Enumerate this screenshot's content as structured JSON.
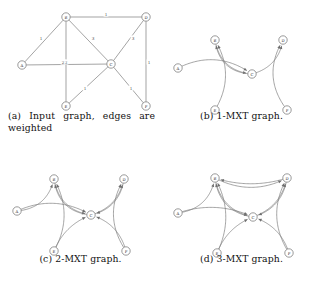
{
  "figure": {
    "panel_count": 4,
    "node_ids": [
      "A",
      "B",
      "C",
      "D",
      "E",
      "F"
    ],
    "edge_color": "#7c7c7c",
    "node_fill": "#ffffff",
    "node_stroke": "#6e6e6e"
  },
  "panels": [
    {
      "key": "a",
      "caption": "(a) Input graph, edges are weighted",
      "caption_label": "(a)",
      "caption_text": "Input graph, edges are weighted",
      "directed": false,
      "nodes": [
        {
          "id": "A",
          "label": "A",
          "x": 22,
          "y": 65
        },
        {
          "id": "B",
          "label": "B",
          "x": 66,
          "y": 17
        },
        {
          "id": "C",
          "label": "C",
          "x": 111,
          "y": 64
        },
        {
          "id": "D",
          "label": "D",
          "x": 146,
          "y": 17
        },
        {
          "id": "E",
          "label": "E",
          "x": 66,
          "y": 106
        },
        {
          "id": "F",
          "label": "F",
          "x": 146,
          "y": 106
        }
      ],
      "edges": [
        {
          "from": "A",
          "to": "B",
          "weight": "1",
          "wx": 41,
          "wy": 38
        },
        {
          "from": "A",
          "to": "C",
          "weight": "2",
          "wx": 66,
          "wy": 62
        },
        {
          "from": "B",
          "to": "D",
          "weight": "1",
          "wx": 106,
          "wy": 14
        },
        {
          "from": "B",
          "to": "C",
          "weight": "3",
          "wx": 93,
          "wy": 38
        },
        {
          "from": "B",
          "to": "E",
          "weight": "2",
          "wx": 63,
          "wy": 62
        },
        {
          "from": "C",
          "to": "D",
          "weight": "3",
          "wx": 133,
          "wy": 38
        },
        {
          "from": "C",
          "to": "E",
          "weight": "1",
          "wx": 85,
          "wy": 88
        },
        {
          "from": "C",
          "to": "F",
          "weight": "1",
          "wx": 131,
          "wy": 88
        },
        {
          "from": "D",
          "to": "F",
          "weight": "1",
          "wx": 149,
          "wy": 62
        }
      ]
    },
    {
      "key": "b",
      "caption": "(b) 1-MXT graph.",
      "caption_label": "(b)",
      "caption_text": "1-MXT graph.",
      "directed": true,
      "nodes": [
        {
          "id": "A",
          "label": "A",
          "x": 17,
          "y": 68
        },
        {
          "id": "B",
          "label": "B",
          "x": 54,
          "y": 40
        },
        {
          "id": "C",
          "label": "C",
          "x": 91,
          "y": 74
        },
        {
          "id": "D",
          "label": "D",
          "x": 122,
          "y": 40
        },
        {
          "id": "E",
          "label": "E",
          "x": 54,
          "y": 110
        },
        {
          "id": "F",
          "label": "F",
          "x": 126,
          "y": 110
        }
      ],
      "arcs": [
        {
          "from": "A",
          "to": "C",
          "bow": -0.3
        },
        {
          "from": "B",
          "to": "C",
          "bow": 0.38
        },
        {
          "from": "C",
          "to": "B",
          "bow": -0.42
        },
        {
          "from": "E",
          "to": "B",
          "bow": 0.3
        },
        {
          "from": "C",
          "to": "D",
          "bow": 0.32
        },
        {
          "from": "F",
          "to": "D",
          "bow": -0.34
        }
      ]
    },
    {
      "key": "c",
      "caption": "(c) 2-MXT graph.",
      "caption_label": "(c)",
      "caption_text": "2-MXT graph.",
      "directed": true,
      "nodes": [
        {
          "id": "A",
          "label": "A",
          "x": 17,
          "y": 68
        },
        {
          "id": "B",
          "label": "B",
          "x": 54,
          "y": 36
        },
        {
          "id": "C",
          "label": "C",
          "x": 91,
          "y": 72
        },
        {
          "id": "D",
          "label": "D",
          "x": 124,
          "y": 36
        },
        {
          "id": "E",
          "label": "E",
          "x": 54,
          "y": 108
        },
        {
          "id": "F",
          "label": "F",
          "x": 126,
          "y": 108
        }
      ],
      "arcs": [
        {
          "from": "A",
          "to": "B",
          "bow": 0.36
        },
        {
          "from": "A",
          "to": "C",
          "bow": -0.26
        },
        {
          "from": "B",
          "to": "C",
          "bow": 0.36
        },
        {
          "from": "C",
          "to": "B",
          "bow": -0.4
        },
        {
          "from": "E",
          "to": "B",
          "bow": 0.28
        },
        {
          "from": "E",
          "to": "C",
          "bow": -0.22
        },
        {
          "from": "C",
          "to": "D",
          "bow": 0.3
        },
        {
          "from": "D",
          "to": "C",
          "bow": -0.34
        },
        {
          "from": "F",
          "to": "D",
          "bow": -0.32
        },
        {
          "from": "F",
          "to": "C",
          "bow": 0.28
        }
      ]
    },
    {
      "key": "d",
      "caption": "(d) 3-MXT graph.",
      "caption_label": "(d)",
      "caption_text": "3-MXT graph.",
      "directed": true,
      "nodes": [
        {
          "id": "A",
          "label": "A",
          "x": 17,
          "y": 70
        },
        {
          "id": "B",
          "label": "B",
          "x": 54,
          "y": 35
        },
        {
          "id": "C",
          "label": "C",
          "x": 92,
          "y": 74
        },
        {
          "id": "D",
          "label": "D",
          "x": 126,
          "y": 35
        },
        {
          "id": "E",
          "label": "E",
          "x": 56,
          "y": 110
        },
        {
          "id": "F",
          "label": "F",
          "x": 128,
          "y": 110
        }
      ],
      "arcs": [
        {
          "from": "A",
          "to": "B",
          "bow": 0.36
        },
        {
          "from": "A",
          "to": "C",
          "bow": -0.2
        },
        {
          "from": "B",
          "to": "C",
          "bow": 0.34
        },
        {
          "from": "C",
          "to": "B",
          "bow": -0.38
        },
        {
          "from": "B",
          "to": "D",
          "bow": 0.26
        },
        {
          "from": "D",
          "to": "B",
          "bow": -0.16
        },
        {
          "from": "E",
          "to": "B",
          "bow": 0.26
        },
        {
          "from": "E",
          "to": "C",
          "bow": -0.22
        },
        {
          "from": "C",
          "to": "D",
          "bow": 0.28
        },
        {
          "from": "D",
          "to": "C",
          "bow": -0.32
        },
        {
          "from": "F",
          "to": "D",
          "bow": -0.3
        },
        {
          "from": "F",
          "to": "C",
          "bow": 0.26
        }
      ]
    }
  ]
}
